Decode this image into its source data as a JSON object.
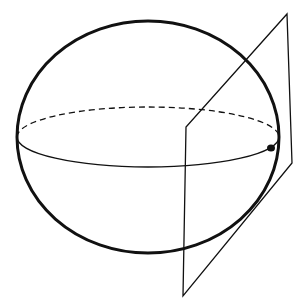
{
  "diagram": {
    "title": "",
    "colors": {
      "stroke": "#111111",
      "background": "#ffffff",
      "point": "#111111"
    },
    "sphere": {
      "cx": 148,
      "cy": 137,
      "rx": 131,
      "ry": 116,
      "stroke_width": 3
    },
    "equator": {
      "cx": 148,
      "cy": 137,
      "rx": 131,
      "ry": 30,
      "front": "solid",
      "back": "dashed",
      "stroke_width": 1.3
    },
    "tangent_plane": {
      "corners": [
        [
          287,
          14
        ],
        [
          292,
          163
        ],
        [
          183,
          296
        ],
        [
          186,
          127
        ]
      ],
      "stroke_width": 1.3
    },
    "tangent_point": {
      "x": 271,
      "y": 148,
      "r": 3.5
    }
  }
}
